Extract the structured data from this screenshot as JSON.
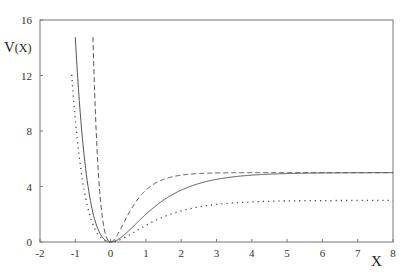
{
  "chart_data": {
    "type": "line",
    "title": "",
    "xlabel": "X",
    "ylabel": "V(X)",
    "ylabel_main": "V",
    "ylabel_arg": "(X)",
    "xlim": [
      -2,
      8
    ],
    "ylim": [
      0,
      16
    ],
    "x_ticks": [
      "-2",
      "-1",
      "0",
      "1",
      "2",
      "3",
      "4",
      "5",
      "6",
      "7",
      "8"
    ],
    "y_ticks": [
      "0",
      "4",
      "8",
      "12",
      "16"
    ],
    "grid": false,
    "legend": null,
    "series": [
      {
        "name": "solid",
        "style": "solid",
        "formula": "5*(1-exp(-x))^2",
        "x": [
          -1.0,
          -0.75,
          -0.5,
          -0.25,
          0,
          0.5,
          1,
          1.5,
          2,
          3,
          4,
          5,
          6,
          7,
          8
        ],
        "values": [
          14.76,
          7.2,
          2.11,
          0.41,
          0,
          0.77,
          2.0,
          3.03,
          3.74,
          4.52,
          4.82,
          4.93,
          4.98,
          4.99,
          5.0
        ]
      },
      {
        "name": "dashed",
        "style": "dashed",
        "formula": "5*(1-exp(-2x))^2",
        "x": [
          -0.5,
          -0.4,
          -0.3,
          -0.2,
          -0.1,
          0,
          0.25,
          0.5,
          1,
          1.5,
          2,
          3,
          4,
          6,
          8
        ],
        "values": [
          14.76,
          9.06,
          4.94,
          2.23,
          0.55,
          0,
          0.77,
          2.0,
          3.74,
          4.52,
          4.82,
          4.98,
          5.0,
          5.0,
          5.0
        ]
      },
      {
        "name": "dotted",
        "style": "dotted",
        "formula": "3*(1-exp(-x))^2",
        "x": [
          -1.1,
          -1.0,
          -0.75,
          -0.5,
          -0.25,
          0,
          0.5,
          1,
          2,
          3,
          4,
          5,
          6,
          7,
          8
        ],
        "values": [
          12.6,
          8.86,
          4.32,
          1.27,
          0.25,
          0,
          0.46,
          1.2,
          2.25,
          2.71,
          2.89,
          2.96,
          2.99,
          2.99,
          3.0
        ]
      }
    ],
    "plot_area_px": {
      "left": 40,
      "top": 20,
      "right": 393,
      "bottom": 242
    },
    "colors": {
      "solid": "#555555",
      "dashed": "#555555",
      "dotted": "#444444",
      "frame": "#777777"
    }
  }
}
